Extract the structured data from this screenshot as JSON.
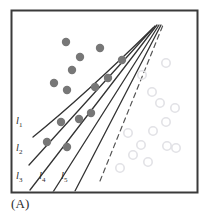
{
  "figure": {
    "caption": "(A)",
    "frame": {
      "x": 11,
      "y": 10,
      "width": 187,
      "height": 183,
      "border_color": "#3a3a3a"
    },
    "background_color": "#ffffff"
  },
  "chart_data": {
    "type": "scatter",
    "title": "",
    "subtitle": "",
    "xlabel": "",
    "ylabel": "",
    "xlim": [
      0,
      211
    ],
    "ylim": [
      218,
      0
    ],
    "grid": false,
    "legend_position": "none",
    "series": [
      {
        "name": "filled-class",
        "marker": "filled-circle",
        "color": "#777777",
        "radius": 4.2,
        "points": [
          [
            66,
            42
          ],
          [
            100,
            48
          ],
          [
            80,
            57
          ],
          [
            72,
            70
          ],
          [
            122,
            60
          ],
          [
            108,
            78
          ],
          [
            54,
            83
          ],
          [
            67,
            90
          ],
          [
            95,
            87
          ],
          [
            91,
            113
          ],
          [
            79,
            119
          ],
          [
            61,
            122
          ],
          [
            47,
            142
          ],
          [
            67,
            147
          ]
        ]
      },
      {
        "name": "open-class",
        "marker": "open-circle",
        "color": "#e2e2e6",
        "radius": 4.2,
        "points": [
          [
            166,
            63
          ],
          [
            142,
            75
          ],
          [
            152,
            92
          ],
          [
            160,
            103
          ],
          [
            175,
            108
          ],
          [
            166,
            122
          ],
          [
            128,
            133
          ],
          [
            153,
            131
          ],
          [
            141,
            145
          ],
          [
            167,
            146
          ],
          [
            176,
            148
          ],
          [
            133,
            155
          ],
          [
            148,
            162
          ],
          [
            120,
            168
          ]
        ]
      }
    ],
    "lines": [
      {
        "label": "l1",
        "label_text": "l",
        "label_sub": "1",
        "label_x": 16,
        "label_y": 124,
        "style": "solid",
        "color": "#333333",
        "width": 1.3,
        "curved": true,
        "path": "M 33 137 C 54 120, 96 84, 153 28"
      },
      {
        "label": "l2",
        "label_text": "l",
        "label_sub": "2",
        "label_x": 16,
        "label_y": 151,
        "style": "solid",
        "color": "#333333",
        "width": 1.3,
        "curved": false,
        "path": "M 29 165 L 155 26"
      },
      {
        "label": "l3",
        "label_text": "l",
        "label_sub": "3",
        "label_x": 16,
        "label_y": 179,
        "style": "solid",
        "color": "#333333",
        "width": 1.3,
        "curved": false,
        "path": "M 30 190 L 157 25"
      },
      {
        "label": "l4",
        "label_text": "l",
        "label_sub": "4",
        "label_x": 39,
        "label_y": 179,
        "style": "solid",
        "color": "#333333",
        "width": 1.3,
        "curved": false,
        "path": "M 53 192 L 159 25"
      },
      {
        "label": "l5",
        "label_text": "l",
        "label_sub": "5",
        "label_x": 61,
        "label_y": 179,
        "style": "solid",
        "color": "#333333",
        "width": 1.3,
        "curved": false,
        "path": "M 75 191 L 161 25"
      },
      {
        "label": "dashed-boundary",
        "label_text": "",
        "label_sub": "",
        "label_x": 0,
        "label_y": 0,
        "style": "dashed",
        "color": "#555555",
        "width": 1.2,
        "curved": false,
        "path": "M 100 181 L 163 25"
      }
    ]
  }
}
